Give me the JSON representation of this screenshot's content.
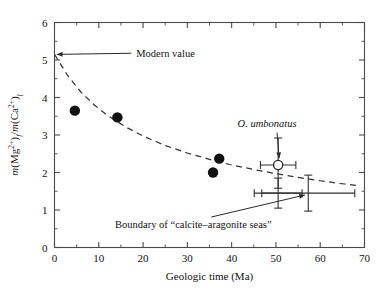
{
  "chart_data": {
    "type": "scatter",
    "title": "",
    "xlabel": "Geologic time (Ma)",
    "ylabel": "m(Mg²⁺)ₗ/m(Ca²⁺)ₗ",
    "ylabel_parts": {
      "m1": "m",
      "mg": "(Mg",
      "mg_sup": "2+",
      "close1": ")",
      "sub1": "l",
      "slash": "/",
      "m2": "m",
      "ca": "(Ca",
      "ca_sup": "2+",
      "close2": ")",
      "sub2": "l"
    },
    "xlim": [
      0,
      70
    ],
    "ylim": [
      0,
      6
    ],
    "x_ticks": [
      0,
      10,
      20,
      30,
      40,
      50,
      60,
      70
    ],
    "x_ticklabels": [
      "0",
      "10",
      "20",
      "30",
      "40",
      "50",
      "60",
      "70"
    ],
    "x_minor_step": 5,
    "y_ticks": [
      0,
      1,
      2,
      3,
      4,
      5,
      6
    ],
    "y_ticklabels": [
      "0",
      "1",
      "2",
      "3",
      "4",
      "5",
      "6"
    ],
    "y_minor_step": 0.5,
    "grid": false,
    "tick_direction": "in",
    "legend": "none",
    "frame": "box",
    "series": [
      {
        "name": "filled-circles",
        "marker": "filled-circle",
        "color": "#111111",
        "points": [
          {
            "x": 4.6,
            "y": 3.65
          },
          {
            "x": 14.2,
            "y": 3.47
          },
          {
            "x": 37.2,
            "y": 2.37
          },
          {
            "x": 35.8,
            "y": 2.0
          }
        ]
      },
      {
        "name": "O. umbonatus",
        "marker": "open-circle",
        "color": "#ffffff",
        "points": [
          {
            "x": 50.5,
            "y": 2.2,
            "xerr_low": 4.0,
            "xerr_high": 4.0,
            "yerr_low": 0.62,
            "yerr_high": 0.72
          }
        ]
      },
      {
        "name": "calcite-aragonite boundary markers",
        "marker": "cross-errorbar",
        "color": "#333333",
        "points": [
          {
            "x": 50.5,
            "y": 1.45,
            "xerr_low": 5.4,
            "xerr_high": 5.4,
            "yerr_low": 0.4,
            "yerr_high": 0.4
          },
          {
            "x": 57.3,
            "y": 1.45,
            "xerr_low": 10.5,
            "xerr_high": 10.5,
            "yerr_low": 0.48,
            "yerr_high": 0.48
          }
        ]
      }
    ],
    "trendline": {
      "name": "fitted decay curve",
      "style": "dashed",
      "color": "#333333",
      "points": [
        {
          "x": 0.0,
          "y": 5.15
        },
        {
          "x": 3.0,
          "y": 4.58
        },
        {
          "x": 6.0,
          "y": 4.14
        },
        {
          "x": 9.0,
          "y": 3.8
        },
        {
          "x": 12.0,
          "y": 3.52
        },
        {
          "x": 16.0,
          "y": 3.22
        },
        {
          "x": 20.0,
          "y": 2.97
        },
        {
          "x": 25.0,
          "y": 2.72
        },
        {
          "x": 30.0,
          "y": 2.52
        },
        {
          "x": 35.0,
          "y": 2.35
        },
        {
          "x": 40.0,
          "y": 2.2
        },
        {
          "x": 45.0,
          "y": 2.08
        },
        {
          "x": 50.0,
          "y": 1.97
        },
        {
          "x": 55.0,
          "y": 1.87
        },
        {
          "x": 60.0,
          "y": 1.78
        },
        {
          "x": 65.0,
          "y": 1.7
        },
        {
          "x": 68.5,
          "y": 1.65
        }
      ]
    },
    "annotations": [
      {
        "id": "modern-value",
        "text": "Modern value",
        "text_x": 18.0,
        "text_y": 5.18,
        "target_x": 0.3,
        "target_y": 5.15,
        "arrow": true
      },
      {
        "id": "o-umbonatus",
        "text": "O. umbonatus",
        "italic": true,
        "text_x": 48.0,
        "text_y": 3.22,
        "target_x": 50.5,
        "target_y": 2.38,
        "arrow": true
      },
      {
        "id": "calcite-aragonite-boundary",
        "text": "Boundary of “calcite–aragonite seas”",
        "text_x": 30.0,
        "text_y": 0.52,
        "target_x": 57.0,
        "target_y": 1.4,
        "arrow": true
      }
    ]
  }
}
